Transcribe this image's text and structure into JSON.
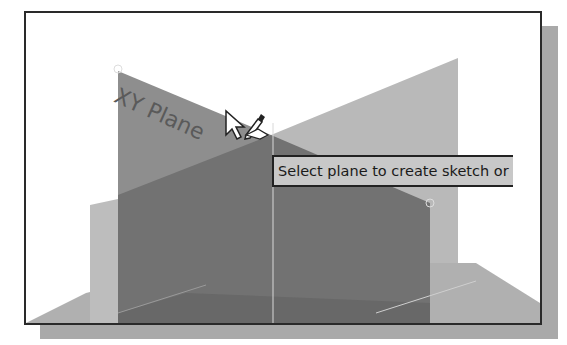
{
  "viewport": {
    "plane_label": "XY Plane",
    "tooltip": "Select plane to create sketch or",
    "cursor": "arrow-with-pencil-cursor"
  },
  "colors": {
    "background": "#ffffff",
    "frame_border": "#2a2a2a",
    "shadow": "#a9a9a9",
    "xy_plane": "#8c8c8c",
    "front_plane": "#6f6f6f",
    "back_plane": "#b4b4b4",
    "tooltip_bg": "#c8c8c8"
  }
}
